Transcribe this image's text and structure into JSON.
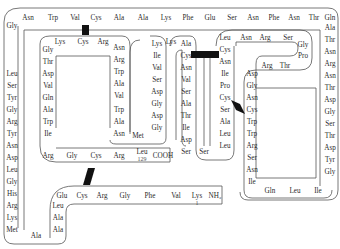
{
  "colors": {
    "line": "#444444",
    "bridge": "#111111",
    "text": "#2a2a2a"
  },
  "termini": {
    "n_terminus": "NH₂",
    "c_terminus": "COOH",
    "first_index": "1",
    "last_index": "129"
  },
  "residues": [
    {
      "name": "Lys",
      "x": 197,
      "y": 196,
      "note": "1"
    },
    {
      "name": "Val",
      "x": 176,
      "y": 196
    },
    {
      "name": "Phe",
      "x": 150,
      "y": 196
    },
    {
      "name": "Gly",
      "x": 125,
      "y": 196
    },
    {
      "name": "Arg",
      "x": 102,
      "y": 196
    },
    {
      "name": "Cys",
      "x": 82,
      "y": 196
    },
    {
      "name": "Glu",
      "x": 62,
      "y": 196
    },
    {
      "name": "Leu",
      "x": 58,
      "y": 206
    },
    {
      "name": "Ala",
      "x": 58,
      "y": 218
    },
    {
      "name": "Ala",
      "x": 58,
      "y": 230
    },
    {
      "name": "Ala",
      "x": 36,
      "y": 236
    },
    {
      "name": "Met",
      "x": 12,
      "y": 230
    },
    {
      "name": "Lys",
      "x": 12,
      "y": 218
    },
    {
      "name": "Arg",
      "x": 12,
      "y": 206
    },
    {
      "name": "His",
      "x": 12,
      "y": 194
    },
    {
      "name": "Gly",
      "x": 12,
      "y": 182
    },
    {
      "name": "Leu",
      "x": 12,
      "y": 170
    },
    {
      "name": "Asp",
      "x": 12,
      "y": 158
    },
    {
      "name": "Asn",
      "x": 12,
      "y": 146
    },
    {
      "name": "Tyr",
      "x": 12,
      "y": 134
    },
    {
      "name": "Arg",
      "x": 12,
      "y": 122
    },
    {
      "name": "Gly",
      "x": 12,
      "y": 110
    },
    {
      "name": "Tyr",
      "x": 12,
      "y": 98
    },
    {
      "name": "Ser",
      "x": 12,
      "y": 86
    },
    {
      "name": "Leu",
      "x": 12,
      "y": 74
    },
    {
      "name": "Gly",
      "x": 12,
      "y": 26
    },
    {
      "name": "Asn",
      "x": 28,
      "y": 18
    },
    {
      "name": "Trp",
      "x": 53,
      "y": 18
    },
    {
      "name": "Val",
      "x": 75,
      "y": 18
    },
    {
      "name": "Cys",
      "x": 96,
      "y": 18
    },
    {
      "name": "Ala",
      "x": 119,
      "y": 18
    },
    {
      "name": "Ala",
      "x": 143,
      "y": 18
    },
    {
      "name": "Lys",
      "x": 166,
      "y": 18
    },
    {
      "name": "Phe",
      "x": 188,
      "y": 18
    },
    {
      "name": "Glu",
      "x": 210,
      "y": 18
    },
    {
      "name": "Ser",
      "x": 232,
      "y": 18
    },
    {
      "name": "Asn",
      "x": 253,
      "y": 18
    },
    {
      "name": "Phe",
      "x": 274,
      "y": 18
    },
    {
      "name": "Asn",
      "x": 294,
      "y": 18
    },
    {
      "name": "Thr",
      "x": 314,
      "y": 18
    },
    {
      "name": "Gln",
      "x": 330,
      "y": 18
    },
    {
      "name": "Ala",
      "x": 330,
      "y": 28
    },
    {
      "name": "Thr",
      "x": 330,
      "y": 40
    },
    {
      "name": "Asn",
      "x": 330,
      "y": 52
    },
    {
      "name": "Arg",
      "x": 330,
      "y": 64
    },
    {
      "name": "Asn",
      "x": 330,
      "y": 76
    },
    {
      "name": "Thr",
      "x": 330,
      "y": 88
    },
    {
      "name": "Asp",
      "x": 330,
      "y": 100
    },
    {
      "name": "Gly",
      "x": 330,
      "y": 112
    },
    {
      "name": "Ser",
      "x": 330,
      "y": 124
    },
    {
      "name": "Thr",
      "x": 330,
      "y": 136
    },
    {
      "name": "Asp",
      "x": 330,
      "y": 148
    },
    {
      "name": "Tyr",
      "x": 330,
      "y": 160
    },
    {
      "name": "Gly",
      "x": 330,
      "y": 172
    },
    {
      "name": "Ile",
      "x": 318,
      "y": 191
    },
    {
      "name": "Leu",
      "x": 295,
      "y": 191
    },
    {
      "name": "Gln",
      "x": 270,
      "y": 191
    },
    {
      "name": "Ile",
      "x": 252,
      "y": 182
    },
    {
      "name": "Asn",
      "x": 252,
      "y": 170
    },
    {
      "name": "Ser",
      "x": 252,
      "y": 158
    },
    {
      "name": "Arg",
      "x": 252,
      "y": 146
    },
    {
      "name": "Trp",
      "x": 252,
      "y": 134
    },
    {
      "name": "Trp",
      "x": 252,
      "y": 122
    },
    {
      "name": "Cys",
      "x": 252,
      "y": 110
    },
    {
      "name": "Asn",
      "x": 252,
      "y": 98
    },
    {
      "name": "Gly",
      "x": 252,
      "y": 86
    },
    {
      "name": "Asp",
      "x": 252,
      "y": 74
    },
    {
      "name": "Arg",
      "x": 267,
      "y": 66
    },
    {
      "name": "Thr",
      "x": 285,
      "y": 66
    },
    {
      "name": "Pro",
      "x": 303,
      "y": 56
    },
    {
      "name": "Gly",
      "x": 303,
      "y": 45
    },
    {
      "name": "Ser",
      "x": 288,
      "y": 38
    },
    {
      "name": "Arg",
      "x": 265,
      "y": 38
    },
    {
      "name": "Asn",
      "x": 246,
      "y": 38
    },
    {
      "name": "Leu",
      "x": 225,
      "y": 38
    },
    {
      "name": "Cys",
      "x": 225,
      "y": 50
    },
    {
      "name": "Asn",
      "x": 225,
      "y": 62
    },
    {
      "name": "Ile",
      "x": 225,
      "y": 74
    },
    {
      "name": "Pro",
      "x": 225,
      "y": 86
    },
    {
      "name": "Cys",
      "x": 225,
      "y": 98
    },
    {
      "name": "Ser",
      "x": 225,
      "y": 110
    },
    {
      "name": "Ala",
      "x": 225,
      "y": 122
    },
    {
      "name": "Leu",
      "x": 225,
      "y": 134
    },
    {
      "name": "Leu",
      "x": 225,
      "y": 146
    },
    {
      "name": "Ser",
      "x": 204,
      "y": 152
    },
    {
      "name": "Ser",
      "x": 186,
      "y": 152
    },
    {
      "name": "Asp",
      "x": 186,
      "y": 140
    },
    {
      "name": "Ile",
      "x": 186,
      "y": 128
    },
    {
      "name": "Thr",
      "x": 186,
      "y": 116
    },
    {
      "name": "Ala",
      "x": 186,
      "y": 104
    },
    {
      "name": "Ser",
      "x": 186,
      "y": 92
    },
    {
      "name": "Val",
      "x": 186,
      "y": 80
    },
    {
      "name": "Asn",
      "x": 186,
      "y": 68
    },
    {
      "name": "Cys",
      "x": 186,
      "y": 56
    },
    {
      "name": "Ala",
      "x": 186,
      "y": 44
    },
    {
      "name": "Lys",
      "x": 171,
      "y": 42
    },
    {
      "name": "Lys",
      "x": 157,
      "y": 44
    },
    {
      "name": "Ile",
      "x": 157,
      "y": 56
    },
    {
      "name": "Val",
      "x": 157,
      "y": 68
    },
    {
      "name": "Ser",
      "x": 157,
      "y": 80
    },
    {
      "name": "Asp",
      "x": 157,
      "y": 92
    },
    {
      "name": "Gly",
      "x": 157,
      "y": 104
    },
    {
      "name": "Asp",
      "x": 157,
      "y": 116
    },
    {
      "name": "Gly",
      "x": 157,
      "y": 128
    },
    {
      "name": "Met",
      "x": 138,
      "y": 136
    },
    {
      "name": "Asn",
      "x": 119,
      "y": 134
    },
    {
      "name": "Ala",
      "x": 119,
      "y": 122
    },
    {
      "name": "Trp",
      "x": 119,
      "y": 110
    },
    {
      "name": "Val",
      "x": 119,
      "y": 96
    },
    {
      "name": "Ala",
      "x": 119,
      "y": 84
    },
    {
      "name": "Trp",
      "x": 119,
      "y": 72
    },
    {
      "name": "Arg",
      "x": 119,
      "y": 60
    },
    {
      "name": "Asn",
      "x": 119,
      "y": 48
    },
    {
      "name": "Arg",
      "x": 103,
      "y": 42
    },
    {
      "name": "Cys",
      "x": 83,
      "y": 42
    },
    {
      "name": "Lys",
      "x": 60,
      "y": 42
    },
    {
      "name": "Gly",
      "x": 48,
      "y": 50
    },
    {
      "name": "Thr",
      "x": 48,
      "y": 62
    },
    {
      "name": "Asp",
      "x": 48,
      "y": 74
    },
    {
      "name": "Val",
      "x": 48,
      "y": 86
    },
    {
      "name": "Gln",
      "x": 48,
      "y": 98
    },
    {
      "name": "Ala",
      "x": 48,
      "y": 110
    },
    {
      "name": "Trp",
      "x": 48,
      "y": 122
    },
    {
      "name": "Ile",
      "x": 48,
      "y": 134
    },
    {
      "name": "Arg",
      "x": 48,
      "y": 156
    },
    {
      "name": "Gly",
      "x": 72,
      "y": 156
    },
    {
      "name": "Cys",
      "x": 96,
      "y": 156
    },
    {
      "name": "Arg",
      "x": 119,
      "y": 156
    },
    {
      "name": "Leu",
      "x": 142,
      "y": 152,
      "note": "129"
    }
  ],
  "c_term_label": {
    "text": "COOH",
    "x": 163,
    "y": 156
  },
  "n_term_label": {
    "text": "NH₂",
    "x": 215,
    "y": 196
  }
}
